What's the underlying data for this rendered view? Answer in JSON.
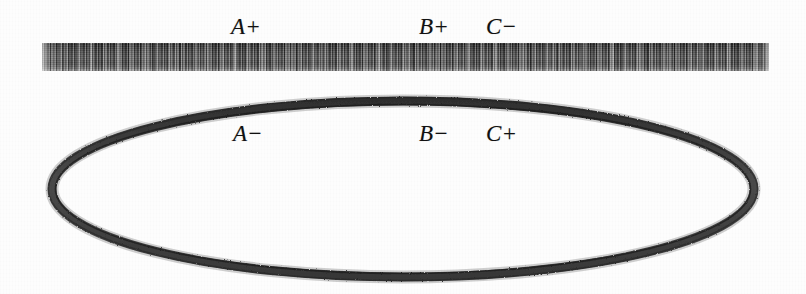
{
  "figure": {
    "background_color": "#fdfdfd",
    "ink_color": "#111111"
  },
  "segment": {
    "name": "horizontal textured bar",
    "fill_color": "#4a4a4a",
    "x": 42,
    "y": 43,
    "width": 727,
    "height": 28
  },
  "curve": {
    "name": "ellipse outline",
    "stroke_color": "#3b3b3b",
    "x": 44,
    "y": 92,
    "width": 718,
    "height": 194
  },
  "labels": {
    "top": [
      {
        "id": "a-plus",
        "letter": "A",
        "sign": "+",
        "text": "A+",
        "x": 231,
        "y": 15
      },
      {
        "id": "b-plus",
        "letter": "B",
        "sign": "+",
        "text": "B+",
        "x": 419,
        "y": 15
      },
      {
        "id": "c-minus",
        "letter": "C",
        "sign": "−",
        "text": "C−",
        "x": 486,
        "y": 15
      }
    ],
    "bottom": [
      {
        "id": "a-minus",
        "letter": "A",
        "sign": "−",
        "text": "A−",
        "x": 233,
        "y": 122
      },
      {
        "id": "b-minus",
        "letter": "B",
        "sign": "−",
        "text": "B−",
        "x": 419,
        "y": 122
      },
      {
        "id": "c-plus",
        "letter": "C",
        "sign": "+",
        "text": "C+",
        "x": 486,
        "y": 122
      }
    ]
  }
}
